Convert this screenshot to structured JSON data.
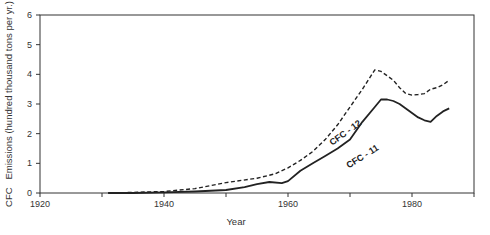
{
  "chart_data": {
    "type": "line",
    "title": "",
    "xlabel": "Year",
    "ylabel": "CFC   Emissions (hundred thousand tons per yr.)",
    "xlim": [
      1920,
      1990
    ],
    "ylim": [
      0,
      6
    ],
    "x_ticks": [
      1920,
      1930,
      1940,
      1950,
      1960,
      1970,
      1980,
      1990
    ],
    "x_tick_labels": [
      "1920",
      "",
      "1940",
      "",
      "1960",
      "",
      "1980",
      ""
    ],
    "y_ticks": [
      0,
      1,
      2,
      3,
      4,
      5,
      6
    ],
    "y_tick_labels": [
      "0",
      "1",
      "2",
      "3",
      "4",
      "5",
      "6"
    ],
    "grid": false,
    "legend": "inline labels on curves",
    "series": [
      {
        "name": "CFC - 12",
        "style": "dashed",
        "color": "#222222",
        "x": [
          1931,
          1935,
          1940,
          1945,
          1950,
          1955,
          1958,
          1960,
          1962,
          1964,
          1966,
          1968,
          1970,
          1972,
          1974,
          1975,
          1976,
          1977,
          1978,
          1979,
          1980,
          1981,
          1982,
          1983,
          1984,
          1985,
          1986
        ],
        "values": [
          0.0,
          0.02,
          0.05,
          0.15,
          0.35,
          0.5,
          0.65,
          0.85,
          1.1,
          1.4,
          1.8,
          2.3,
          2.9,
          3.5,
          4.15,
          4.1,
          3.95,
          3.8,
          3.55,
          3.35,
          3.3,
          3.32,
          3.35,
          3.5,
          3.55,
          3.65,
          3.8
        ]
      },
      {
        "name": "CFC - 11",
        "style": "solid",
        "color": "#222222",
        "x": [
          1931,
          1935,
          1940,
          1945,
          1950,
          1953,
          1955,
          1957,
          1959,
          1960,
          1962,
          1964,
          1966,
          1968,
          1970,
          1972,
          1974,
          1975,
          1976,
          1977,
          1978,
          1979,
          1980,
          1981,
          1982,
          1983,
          1984,
          1985,
          1986
        ],
        "values": [
          0.0,
          0.0,
          0.02,
          0.05,
          0.1,
          0.2,
          0.3,
          0.37,
          0.33,
          0.4,
          0.75,
          1.0,
          1.25,
          1.5,
          1.8,
          2.4,
          2.9,
          3.15,
          3.15,
          3.1,
          3.0,
          2.85,
          2.7,
          2.55,
          2.45,
          2.4,
          2.6,
          2.75,
          2.85
        ]
      }
    ],
    "annotations": [
      {
        "text": "CFC - 12",
        "near": "dashed curve around 1966",
        "rotation_deg": -36
      },
      {
        "text": "CFC - 11",
        "near": "solid curve around 1967",
        "rotation_deg": -32
      }
    ]
  }
}
